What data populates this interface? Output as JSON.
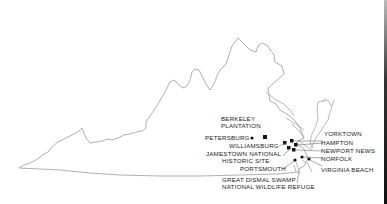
{
  "map": {
    "region": "Virginia",
    "colors": {
      "outline": "#9a9a9a",
      "marker": "#111111",
      "text": "#222222",
      "leader": "#555555"
    },
    "places": [
      {
        "id": "berkeley-plantation",
        "lines": [
          "BERKELEY",
          "PLANTATION"
        ]
      },
      {
        "id": "petersburg",
        "lines": [
          "PETERSBURG"
        ]
      },
      {
        "id": "williamsburg",
        "lines": [
          "WILLIAMSBURG"
        ]
      },
      {
        "id": "jamestown",
        "lines": [
          "JAMESTOWN NATIONAL",
          "HISTORIC SITE"
        ]
      },
      {
        "id": "portsmouth",
        "lines": [
          "PORTSMOUTH"
        ]
      },
      {
        "id": "great-dismal-swamp",
        "lines": [
          "GREAT DISMAL SWAMP",
          "NATIONAL WILDLIFE REFUGE"
        ]
      },
      {
        "id": "yorktown",
        "lines": [
          "YORKTOWN"
        ]
      },
      {
        "id": "hampton",
        "lines": [
          "HAMPTON"
        ]
      },
      {
        "id": "newport-news",
        "lines": [
          "NEWPORT NEWS"
        ]
      },
      {
        "id": "norfolk",
        "lines": [
          "NORFOLK"
        ]
      },
      {
        "id": "virginia-beach",
        "lines": [
          "VIRGINIA BEACH"
        ]
      }
    ]
  }
}
